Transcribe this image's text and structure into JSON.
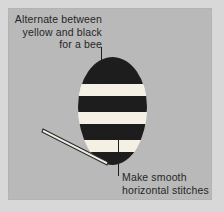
{
  "figure": {
    "canvas": {
      "width": 224,
      "height": 212
    },
    "colors": {
      "outer_background": "#d8d8d8",
      "panel_background": "#b9b9b9",
      "stripe_dark": "#1d1d1d",
      "stripe_light": "#f4f1e4",
      "text": "#262626",
      "leader_line": "#1e1e1e",
      "needle": "#2a2a2a"
    }
  },
  "callouts": {
    "top": {
      "lines": [
        "Alternate between",
        "yellow and black",
        "for a bee"
      ],
      "align": "right"
    },
    "bottom": {
      "lines": [
        "Make smooth",
        "horizontal stitches"
      ],
      "align": "left"
    }
  },
  "diagram": {
    "oval": {
      "label": "striped-oval-body",
      "left": 78,
      "top": 57,
      "width": 69,
      "height": 108,
      "stripes": [
        {
          "name": "band-1",
          "color": "dark",
          "top": 0,
          "height": 27
        },
        {
          "name": "band-2",
          "color": "light",
          "top": 27,
          "height": 12
        },
        {
          "name": "band-3",
          "color": "dark",
          "top": 39,
          "height": 16
        },
        {
          "name": "band-4",
          "color": "light",
          "top": 55,
          "height": 12
        },
        {
          "name": "band-5",
          "color": "dark",
          "top": 67,
          "height": 16
        },
        {
          "name": "band-6",
          "color": "light",
          "top": 83,
          "height": 12
        },
        {
          "name": "band-7",
          "color": "dark",
          "top": 95,
          "height": 13
        }
      ]
    },
    "needle": {
      "label": "sewing-needle",
      "x1": 4,
      "y1": 4,
      "x2": 68,
      "y2": 37
    },
    "leaders": [
      {
        "name": "leader-top",
        "x": 101,
        "y": 47,
        "length": 34
      },
      {
        "name": "leader-bottom",
        "x": 118,
        "y": 137,
        "length": 39
      }
    ]
  }
}
